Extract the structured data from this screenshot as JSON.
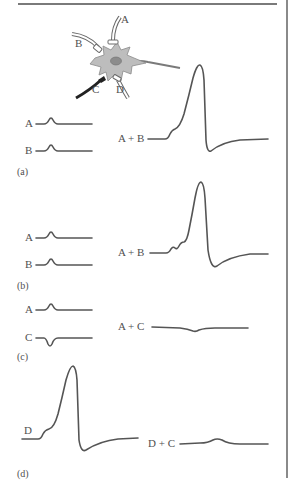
{
  "figure": {
    "neuron_labels": {
      "a": "A",
      "b": "B",
      "c": "C",
      "d": "D"
    },
    "panels": {
      "a": {
        "tag": "(a)",
        "inputs": [
          {
            "label": "A",
            "response": "EPSP"
          },
          {
            "label": "B",
            "response": "EPSP"
          }
        ],
        "combined": {
          "label": "A + B",
          "response": "action potential (spatial summation)"
        }
      },
      "b": {
        "tag": "(b)",
        "inputs": [
          {
            "label": "A",
            "response": "EPSP"
          },
          {
            "label": "B",
            "response": "EPSP"
          }
        ],
        "combined": {
          "label": "A + B",
          "response": "action potential (temporal summation, staggered EPSPs)"
        }
      },
      "c": {
        "tag": "(c)",
        "inputs": [
          {
            "label": "A",
            "response": "EPSP"
          },
          {
            "label": "C",
            "response": "IPSP"
          }
        ],
        "combined": {
          "label": "A + C",
          "response": "small hyperpolarization, no spike"
        }
      },
      "d": {
        "tag": "(d)",
        "inputs": [
          {
            "label": "D",
            "response": "action potential"
          }
        ],
        "combined": {
          "label": "D + C",
          "response": "small depolarization, no spike"
        }
      }
    },
    "colors": {
      "trace": "#555555",
      "soma_fill": "#bdbdbd",
      "nucleus": "#8c8c8c",
      "inhibitory_axon": "#222222",
      "rule": "#7a7a7a"
    }
  }
}
